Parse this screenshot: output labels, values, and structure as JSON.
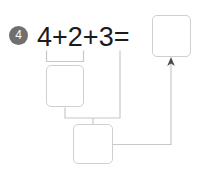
{
  "worksheet": {
    "problem_number": "4",
    "equation": {
      "full_text": "4+2+3=",
      "terms": [
        "4",
        "2",
        "3"
      ],
      "operators": [
        "+",
        "+"
      ],
      "equals": "="
    },
    "answer_boxes": [
      {
        "id": "box-total",
        "label": "total-answer-box",
        "value": ""
      },
      {
        "id": "box-step1",
        "label": "first-partial-sum-box",
        "value": ""
      },
      {
        "id": "box-step2",
        "label": "second-partial-sum-box",
        "value": ""
      }
    ],
    "colors": {
      "badge_fill": "#6f6f6f",
      "badge_text": "#ffffff",
      "equation_text": "#1b1b1b",
      "box_border": "#cfcfcf",
      "connector_line": "#c8c8c8",
      "arrow_head": "#4a4a4a",
      "background": "#ffffff"
    }
  }
}
